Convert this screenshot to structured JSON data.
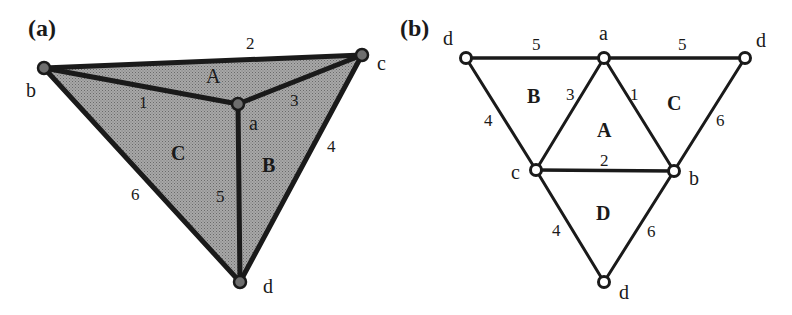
{
  "panels": [
    {
      "label": "(a)",
      "description": "3D tetrahedron drawing",
      "vertices": {
        "a": "a",
        "b": "b",
        "c": "c",
        "d": "d"
      },
      "edges": {
        "e1": "1",
        "e2": "2",
        "e3": "3",
        "e4": "4",
        "e5": "5",
        "e6": "6"
      },
      "faces": {
        "A": "A",
        "B": "B",
        "C": "C"
      }
    },
    {
      "label": "(b)",
      "description": "Unfolded net of tetrahedron",
      "vertices": {
        "d_left": "d",
        "a_top": "a",
        "d_right": "d",
        "c": "c",
        "b": "b",
        "d_bottom": "d"
      },
      "edges": {
        "top_left": "5",
        "top_right": "5",
        "left_outer": "4",
        "a_c": "3",
        "a_b": "1",
        "right_outer": "6",
        "c_b": "2",
        "c_d": "4",
        "b_d": "6"
      },
      "faces": {
        "A": "A",
        "B": "B",
        "C": "C",
        "D": "D"
      }
    }
  ],
  "colors": {
    "fill": "#9a9a9a",
    "stroke": "#1a1a1a",
    "node_fill_a": "#6e6e6e",
    "node_fill_b": "#ffffff"
  }
}
